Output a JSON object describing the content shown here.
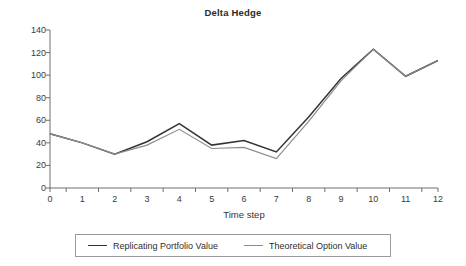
{
  "chart_data": {
    "type": "line",
    "title": "Delta Hedge",
    "xlabel": "Time step",
    "ylabel": "",
    "x": [
      0,
      1,
      2,
      3,
      4,
      5,
      6,
      7,
      8,
      9,
      10,
      11,
      12
    ],
    "categories": [
      "0",
      "1",
      "2",
      "3",
      "4",
      "5",
      "6",
      "7",
      "8",
      "9",
      "10",
      "11",
      "12"
    ],
    "series": [
      {
        "name": "Replicating Portfolio Value",
        "color": "#333333",
        "values": [
          48,
          40,
          30,
          41,
          57,
          38,
          42,
          32,
          63,
          97,
          123,
          99,
          113
        ]
      },
      {
        "name": "Theoretical Option Value",
        "color": "#8c8c8c",
        "values": [
          48,
          40,
          30,
          38,
          52,
          35,
          36,
          26,
          59,
          95,
          123,
          99,
          113
        ]
      }
    ],
    "ylim": [
      0,
      140
    ],
    "yticks": [
      0,
      20,
      40,
      60,
      80,
      100,
      120,
      140
    ],
    "ytick_labels": [
      "0",
      "20",
      "40",
      "60",
      "80",
      "100",
      "120",
      "140"
    ],
    "xlim": [
      0,
      12
    ],
    "grid": false,
    "legend_position": "bottom"
  },
  "legend": {
    "entries": [
      {
        "label": "Replicating Portfolio Value"
      },
      {
        "label": "Theoretical Option Value"
      }
    ]
  },
  "axis": {
    "x_title": "Time step"
  }
}
